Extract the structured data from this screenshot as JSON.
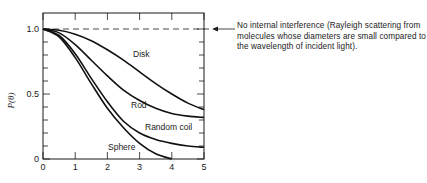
{
  "chart_data": {
    "type": "line",
    "title": "",
    "xlabel": "",
    "ylabel": "P(θ)",
    "xlim": [
      0,
      5
    ],
    "ylim": [
      0,
      1.0
    ],
    "x_ticks": [
      "0",
      "1",
      "2",
      "3",
      "4",
      "5"
    ],
    "y_ticks": [
      "0",
      "0.5",
      "1.0"
    ],
    "grid": false,
    "legend": "none (curves labeled inline)",
    "reference_line": {
      "y": 1.0,
      "style": "dashed",
      "annotation": "No internal interference (Rayleigh scattering from molecules whose diameters are small compared to the wavelength of incident light)."
    },
    "series": [
      {
        "name": "Disk",
        "x": [
          0,
          0.5,
          1,
          1.5,
          2,
          2.5,
          3,
          3.5,
          4,
          4.5,
          5
        ],
        "values": [
          1.0,
          0.99,
          0.96,
          0.91,
          0.84,
          0.76,
          0.67,
          0.58,
          0.5,
          0.43,
          0.38
        ]
      },
      {
        "name": "Rod",
        "x": [
          0,
          0.5,
          1,
          1.5,
          2,
          2.5,
          3,
          3.5,
          4,
          4.5,
          5
        ],
        "values": [
          1.0,
          0.97,
          0.88,
          0.76,
          0.64,
          0.53,
          0.45,
          0.39,
          0.35,
          0.33,
          0.32
        ]
      },
      {
        "name": "Random coil",
        "x": [
          0,
          0.5,
          1,
          1.5,
          2,
          2.5,
          3,
          3.5,
          4,
          4.5,
          5
        ],
        "values": [
          1.0,
          0.95,
          0.81,
          0.62,
          0.44,
          0.29,
          0.2,
          0.15,
          0.12,
          0.1,
          0.09
        ]
      },
      {
        "name": "Sphere",
        "x": [
          0,
          0.5,
          1,
          1.5,
          2,
          2.5,
          3,
          3.5,
          4
        ],
        "values": [
          1.0,
          0.94,
          0.78,
          0.58,
          0.39,
          0.24,
          0.12,
          0.04,
          0.0
        ]
      }
    ]
  },
  "labels": {
    "ylabel": "P(θ)",
    "disk": "Disk",
    "rod": "Rod",
    "random_coil": "Random coil",
    "sphere": "Sphere",
    "annotation": "No internal interference (Rayleigh scattering from molecules whose diameters are small compared to the wavelength of incident light)."
  }
}
